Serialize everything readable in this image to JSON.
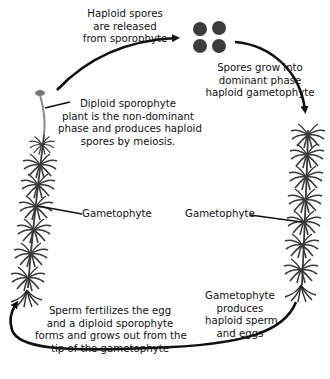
{
  "diagram": {
    "labels": {
      "spores_released": [
        "Haploid spores",
        "are released",
        "from sporophyte"
      ],
      "spores_grow": [
        "Spores grow into",
        "dominant phase",
        "haploid gametophyte"
      ],
      "sporophyte": [
        "Diploid sporophyte",
        "plant is the non-dominant",
        "phase and produces haploid",
        "spores by meiosis."
      ],
      "gametophyte_left": "Gametophyte",
      "gametophyte_right": "Gametophyte",
      "fertilization": [
        "Sperm fertilizes the egg",
        "and a diploid sporophyte",
        "forms and grows out from the",
        "tip of the gametophyte"
      ],
      "gametes": [
        "Gametophyte",
        "produces",
        "haploid sperm",
        "and eggs"
      ]
    },
    "colors": {
      "background": "#ffffff",
      "arrow": "#111111",
      "plant": "#3a3a3a",
      "spore": "#3c3c3c"
    }
  }
}
